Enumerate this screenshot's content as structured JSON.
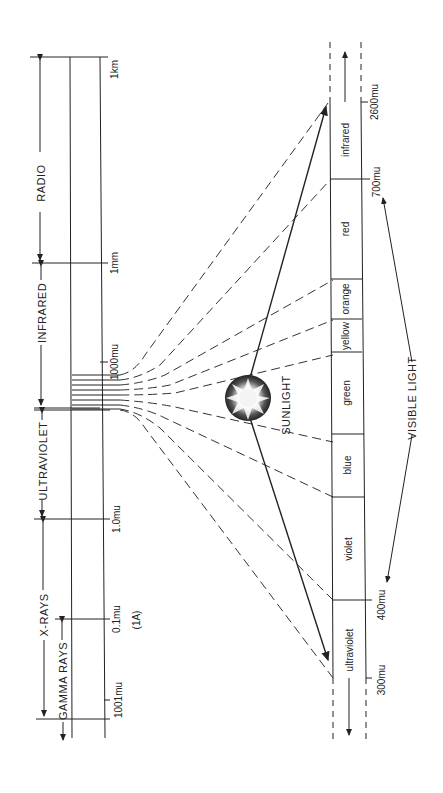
{
  "diagram": {
    "spectrum_scale": {
      "bands": [
        {
          "label": "RADIO"
        },
        {
          "label": "INFRARED"
        },
        {
          "label": "ULTRAVIOLET"
        },
        {
          "label": "X-RAYS"
        },
        {
          "label": "GAMMA RAYS"
        }
      ],
      "ticks": [
        {
          "label": "1km"
        },
        {
          "label": "1mm"
        },
        {
          "label": "1000mu"
        },
        {
          "label": "1.0mu"
        },
        {
          "label": "0.1mu"
        },
        {
          "label": "(1A)"
        },
        {
          "label": "1001mu"
        }
      ]
    },
    "source": {
      "label": "SUNLIGHT"
    },
    "visible_scale": {
      "segments": [
        {
          "label": "infrared"
        },
        {
          "label": "red"
        },
        {
          "label": "orange"
        },
        {
          "label": "yellow"
        },
        {
          "label": "green"
        },
        {
          "label": "blue"
        },
        {
          "label": "violet"
        },
        {
          "label": "ultraviolet"
        }
      ],
      "ticks": [
        {
          "label": "2600mu"
        },
        {
          "label": "700mu"
        },
        {
          "label": "400mu"
        },
        {
          "label": "300mu"
        }
      ],
      "range_label": "VISIBLE LIGHT"
    },
    "colors": {
      "ink": "#222222",
      "paper": "#ffffff"
    }
  }
}
